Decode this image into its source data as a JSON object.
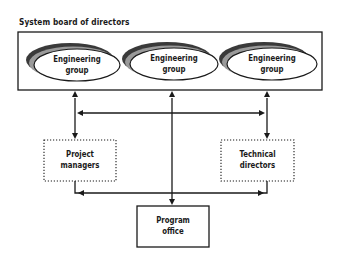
{
  "diagram": {
    "title": "System board of directors",
    "engineering_groups": [
      {
        "line1": "Engineering",
        "line2": "group"
      },
      {
        "line1": "Engineering",
        "line2": "group"
      },
      {
        "line1": "Engineering",
        "line2": "group"
      }
    ],
    "project_managers": {
      "line1": "Project",
      "line2": "managers"
    },
    "technical_directors": {
      "line1": "Technical",
      "line2": "directors"
    },
    "program_office": {
      "line1": "Program",
      "line2": "office"
    },
    "colors": {
      "line": "#1a1a1a",
      "shadow_dark": "#3a3a3a",
      "shadow_gray": "#9a9a9a",
      "background": "#ffffff"
    }
  }
}
